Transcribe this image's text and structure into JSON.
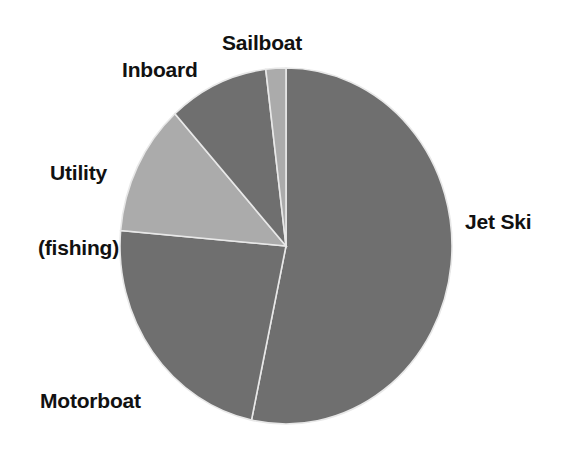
{
  "chart_data": {
    "type": "pie",
    "title": "",
    "subtitle": "",
    "xlabel": "",
    "ylabel": "",
    "grid": false,
    "legend_position": "none",
    "label_style": "outside-callout",
    "categories": [
      "Jet Ski",
      "Motorboat",
      "Utility (fishing)",
      "Inboard",
      "Sailboat"
    ],
    "values": [
      53,
      23,
      12,
      10,
      2
    ],
    "unit": "percent",
    "slices": [
      {
        "label": "Jet Ski",
        "value": 53,
        "start_angle_deg": 0,
        "end_angle_deg": 192,
        "color": "#6f6f6f",
        "shade": "dark-gray"
      },
      {
        "label": "Motorboat",
        "value": 23,
        "start_angle_deg": 192,
        "end_angle_deg": 275,
        "color": "#6f6f6f",
        "shade": "dark-gray"
      },
      {
        "label": "Utility (fishing)",
        "value": 12,
        "start_angle_deg": 275,
        "end_angle_deg": 318,
        "color": "#ababab",
        "shade": "light-gray"
      },
      {
        "label": "Inboard",
        "value": 10,
        "start_angle_deg": 318,
        "end_angle_deg": 353,
        "color": "#6f6f6f",
        "shade": "dark-gray"
      },
      {
        "label": "Sailboat",
        "value": 2,
        "start_angle_deg": 353,
        "end_angle_deg": 360,
        "color": "#ababab",
        "shade": "light-gray"
      }
    ]
  },
  "labels": {
    "sailboat": "Sailboat",
    "inboard": "Inboard",
    "utility_line1": "Utility",
    "utility_line2": "(fishing)",
    "jet_ski": "Jet Ski",
    "motorboat": "Motorboat"
  },
  "style": {
    "background": "#ffffff",
    "dark_slice": "#6f6f6f",
    "light_slice": "#ababab",
    "separator": "#e8e8e8",
    "text": "#111111"
  },
  "geometry": {
    "center_x": 286,
    "center_y": 246,
    "radius_x": 166,
    "radius_y": 178
  }
}
